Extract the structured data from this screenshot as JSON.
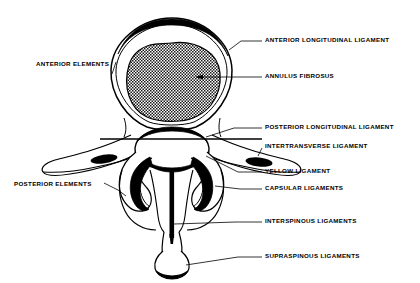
{
  "figure": {
    "type": "anatomical-diagram",
    "background_color": "#ffffff",
    "ink_color": "#000000"
  },
  "labels": {
    "anterior_longitudinal_ligament": "ANTERIOR LONGITUDINAL LIGAMENT",
    "annulus_fibrosus": "ANNULUS FIBROSUS",
    "posterior_longitudinal_ligament": "POSTERIOR LONGITUDINAL LIGAMENT",
    "intertransverse_ligament": "INTERTRANSVERSE LIGAMENT",
    "yellow_ligament": "YELLOW LIGAMENT",
    "capsular_ligaments": "CAPSULAR LIGAMENTS",
    "interspinous_ligaments": "INTERSPINOUS LIGAMENTS",
    "supraspinous_ligaments": "SUPRASPINOUS LIGAMENTS",
    "anterior_elements": "ANTERIOR ELEMENTS",
    "posterior_elements": "POSTERIOR ELEMENTS"
  },
  "structures": {
    "vertebral_body": "vertebral-body-outline",
    "disc": "annulus-fibrosus-hatched-disc",
    "spinal_canal": "spinal-canal-outline",
    "transverse_process_left": "left-transverse-process",
    "transverse_process_right": "right-transverse-process",
    "spinous_process": "spinous-process",
    "facet_left": "left-facet-joint",
    "facet_right": "right-facet-joint"
  }
}
